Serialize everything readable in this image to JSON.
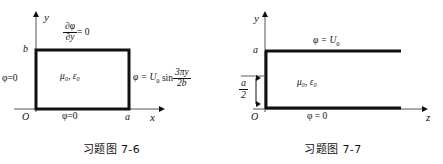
{
  "page": {
    "background": "#ffffff",
    "ink": "#111111",
    "width": 443,
    "height": 164
  },
  "figures": [
    {
      "id": "fig-7-6",
      "caption": "习题图 7-6",
      "caption_label": "习题图",
      "caption_number": "7-6",
      "axes": {
        "x_label": "x",
        "y_label": "y",
        "origin_label": "O"
      },
      "ticks": {
        "y_top": "b",
        "x_right": "a"
      },
      "medium": {
        "mu": "μ",
        "mu_sub": "0",
        "eps": "ε",
        "eps_sub": "0",
        "text": "μ₀, ε₀"
      },
      "boundary_conditions": {
        "top": {
          "name": "neumann-top",
          "numerator": "∂φ",
          "denominator": "∂y",
          "rhs": "= 0",
          "text": "∂φ/∂y = 0"
        },
        "left": {
          "name": "dirichlet-left",
          "text": "φ=0"
        },
        "bottom": {
          "name": "dirichlet-bottom",
          "text": "φ=0"
        },
        "right": {
          "name": "sinusoidal-right",
          "lhs": "φ = U",
          "lhs_sub": "0",
          "fn": "sin",
          "numerator": "3πy",
          "denominator": "2b",
          "text": "φ = U₀ sin(3πy/2b)"
        }
      }
    },
    {
      "id": "fig-7-7",
      "caption": "习题图 7-7",
      "caption_label": "习题图",
      "caption_number": "7-7",
      "axes": {
        "x_label": "z",
        "y_label": "y",
        "origin_label": "O"
      },
      "ticks": {
        "y_top": "a"
      },
      "gap_dimension": {
        "numerator": "a",
        "denominator": "2",
        "text": "a/2"
      },
      "medium": {
        "text": "μ₀, ε₀"
      },
      "boundary_conditions": {
        "top_plate": {
          "name": "dirichlet-top-plate",
          "lhs": "φ = U",
          "lhs_sub": "0",
          "text": "φ = U₀"
        },
        "bottom_plate": {
          "name": "dirichlet-bottom-plate",
          "text": "φ = 0"
        }
      }
    }
  ]
}
